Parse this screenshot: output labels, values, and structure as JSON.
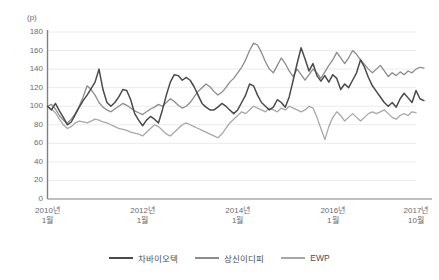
{
  "chart_data": {
    "type": "line",
    "title": "",
    "subtitle": "",
    "xlabel": "",
    "ylabel": "",
    "unit_label": "(p)",
    "ylim": [
      0,
      180
    ],
    "yticks": [
      0,
      20,
      40,
      60,
      80,
      100,
      120,
      140,
      160,
      180
    ],
    "grid": true,
    "grid_axis": "y",
    "legend_position": "bottom-center",
    "x_axis_type": "monthly",
    "x_start": "2010-01",
    "x_end": "2017-10",
    "n_points": 94,
    "xticks": [
      {
        "index": 0,
        "line1": "2010년",
        "line2": "1월"
      },
      {
        "index": 24,
        "line1": "2012년",
        "line2": "1월"
      },
      {
        "index": 48,
        "line1": "2014년",
        "line2": "1월"
      },
      {
        "index": 72,
        "line1": "2016년",
        "line2": "1월"
      },
      {
        "index": 93,
        "line1": "2017년",
        "line2": "10월"
      }
    ],
    "series": [
      {
        "name": "차바이오텍",
        "color": "#4a4a4c",
        "values": [
          100,
          96,
          103,
          95,
          88,
          80,
          83,
          91,
          99,
          106,
          112,
          119,
          126,
          140,
          118,
          104,
          100,
          104,
          110,
          118,
          117,
          107,
          92,
          85,
          79,
          85,
          89,
          86,
          82,
          96,
          112,
          126,
          134,
          133,
          128,
          131,
          128,
          121,
          112,
          103,
          99,
          96,
          96,
          99,
          103,
          100,
          96,
          92,
          96,
          104,
          112,
          124,
          122,
          112,
          104,
          100,
          96,
          99,
          107,
          104,
          99,
          110,
          128,
          146,
          163,
          151,
          138,
          146,
          133,
          127,
          133,
          126,
          134,
          130,
          118,
          124,
          120,
          128,
          136,
          150,
          142,
          131,
          122,
          116,
          110,
          104,
          100,
          104,
          99,
          108,
          114,
          109,
          104,
          117,
          108,
          106
        ]
      },
      {
        "name": "상신이디피",
        "color": "#8c8c8e",
        "values": [
          100,
          102,
          97,
          90,
          85,
          82,
          86,
          92,
          100,
          110,
          122,
          118,
          112,
          104,
          99,
          96,
          94,
          97,
          100,
          103,
          101,
          98,
          95,
          93,
          91,
          94,
          97,
          99,
          102,
          100,
          104,
          108,
          105,
          101,
          98,
          100,
          104,
          110,
          116,
          120,
          124,
          121,
          116,
          112,
          115,
          120,
          126,
          130,
          136,
          142,
          150,
          160,
          168,
          166,
          158,
          148,
          140,
          136,
          144,
          152,
          146,
          138,
          132,
          140,
          134,
          128,
          134,
          140,
          136,
          130,
          137,
          144,
          150,
          158,
          152,
          146,
          152,
          160,
          156,
          150,
          145,
          140,
          136,
          140,
          144,
          138,
          132,
          136,
          133,
          137,
          134,
          138,
          136,
          140,
          142,
          141
        ]
      },
      {
        "name": "EWP",
        "color": "#a8a8aa",
        "values": [
          100,
          97,
          93,
          86,
          80,
          76,
          78,
          82,
          84,
          83,
          82,
          84,
          86,
          85,
          83,
          82,
          80,
          78,
          76,
          75,
          74,
          72,
          71,
          70,
          68,
          72,
          76,
          80,
          78,
          74,
          70,
          68,
          72,
          76,
          80,
          82,
          80,
          78,
          76,
          74,
          72,
          70,
          68,
          66,
          70,
          76,
          82,
          86,
          90,
          94,
          92,
          96,
          100,
          98,
          96,
          94,
          98,
          96,
          94,
          98,
          96,
          100,
          98,
          96,
          94,
          96,
          100,
          98,
          88,
          76,
          64,
          78,
          88,
          94,
          90,
          84,
          88,
          92,
          88,
          84,
          88,
          92,
          94,
          92,
          94,
          96,
          92,
          88,
          86,
          90,
          92,
          90,
          94,
          93
        ]
      }
    ]
  },
  "legend": {
    "items": [
      {
        "label": "차바이오텍",
        "color": "#4a4a4c"
      },
      {
        "label": "상신이디피",
        "color": "#8c8c8e"
      },
      {
        "label": "EWP",
        "color": "#a8a8aa"
      }
    ]
  },
  "axis": {
    "unit_label": "(p)",
    "axis_color": "#808082",
    "grid_color": "#eceaee"
  }
}
